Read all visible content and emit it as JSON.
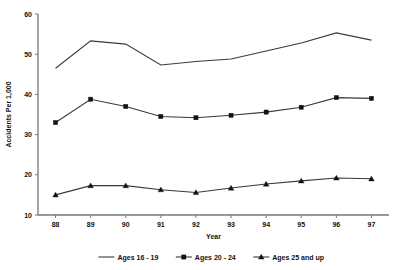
{
  "chart_data": {
    "type": "line",
    "title": "",
    "xlabel": "Year",
    "ylabel": "Accidents Per 1,000",
    "categories": [
      "88",
      "89",
      "90",
      "91",
      "92",
      "93",
      "94",
      "95",
      "96",
      "97"
    ],
    "xticklabels": [
      "88",
      "89",
      "90",
      "91",
      "92",
      "93",
      "94",
      "95",
      "96",
      "97"
    ],
    "yticklabels": [
      "10",
      "20",
      "30",
      "40",
      "50",
      "60"
    ],
    "yticks": [
      10,
      20,
      30,
      40,
      50,
      60
    ],
    "ylim": [
      10,
      60
    ],
    "grid": false,
    "legend_position": "bottom",
    "series": [
      {
        "name": "Ages 16 - 19",
        "marker": "none",
        "values": [
          46.5,
          53.3,
          52.5,
          47.3,
          48.2,
          48.8,
          50.8,
          52.8,
          55.3,
          53.5
        ]
      },
      {
        "name": "Ages 20 - 24",
        "marker": "square",
        "values": [
          33.0,
          38.8,
          37.0,
          34.5,
          34.2,
          34.8,
          35.6,
          36.8,
          39.2,
          39.0
        ]
      },
      {
        "name": "Ages 25 and up",
        "marker": "triangle",
        "values": [
          15.0,
          17.3,
          17.3,
          16.3,
          15.6,
          16.7,
          17.7,
          18.5,
          19.2,
          19.0
        ]
      }
    ],
    "colors": {
      "line": "#3a3a3a",
      "marker": "#111111",
      "axis": "#777777",
      "text": "#111111",
      "background": "#ffffff"
    }
  }
}
